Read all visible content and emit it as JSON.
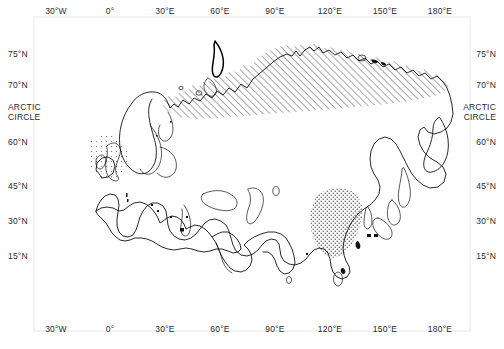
{
  "figure": {
    "type": "map",
    "title": "",
    "projection_note": "Eurasia coastline outline map with latitude and longitude graticule labels",
    "background_color": "#ffffff",
    "line_color": "#111111",
    "label_color": "#2b2b2b",
    "width": 504,
    "height": 349
  },
  "axes": {
    "longitude_top": [
      {
        "label": "30°W",
        "x": 56
      },
      {
        "label": "0°",
        "x": 110
      },
      {
        "label": "30°E",
        "x": 165
      },
      {
        "label": "60°E",
        "x": 220
      },
      {
        "label": "90°E",
        "x": 275
      },
      {
        "label": "120°E",
        "x": 330
      },
      {
        "label": "150°E",
        "x": 385
      },
      {
        "label": "180°E",
        "x": 440
      }
    ],
    "longitude_bottom": [
      {
        "label": "30°W",
        "x": 56
      },
      {
        "label": "0°",
        "x": 110
      },
      {
        "label": "30°E",
        "x": 165
      },
      {
        "label": "60°E",
        "x": 220
      },
      {
        "label": "90°E",
        "x": 275
      },
      {
        "label": "120°E",
        "x": 330
      },
      {
        "label": "150°E",
        "x": 385
      },
      {
        "label": "180°E",
        "x": 440
      }
    ],
    "latitude_left": [
      {
        "label": "75°N",
        "y": 53
      },
      {
        "label": "70°N",
        "y": 84
      },
      {
        "label": "ARCTIC",
        "y": 106,
        "label2": "CIRCLE"
      },
      {
        "label": "60°N",
        "y": 141
      },
      {
        "label": "45°N",
        "y": 185
      },
      {
        "label": "30°N",
        "y": 220
      },
      {
        "label": "15°N",
        "y": 255
      }
    ],
    "latitude_right": [
      {
        "label": "75°N",
        "y": 53
      },
      {
        "label": "70°N",
        "y": 84
      },
      {
        "label": "ARCTIC",
        "y": 106,
        "label2": "CIRCLE"
      },
      {
        "label": "60°N",
        "y": 141
      },
      {
        "label": "45°N",
        "y": 185
      },
      {
        "label": "30°N",
        "y": 220
      },
      {
        "label": "15°N",
        "y": 255
      }
    ],
    "arctic_circle_text_line1": "ARCTIC",
    "arctic_circle_text_line2": "CIRCLE"
  },
  "regions": [
    {
      "name": "northern-siberia-hatched-zone",
      "pattern": "diagonal-hatch",
      "description": "Hatched band along the Arctic coast of northern Siberia between roughly 60°E and 170°E"
    },
    {
      "name": "eastern-china-stippled-zone",
      "pattern": "stipple-dots",
      "description": "Stippled area over eastern China between roughly 105°E and 122°E, 25°N to 42°N"
    },
    {
      "name": "north-sea-stippled-zone",
      "pattern": "stipple-dots-light",
      "description": "Light stippling around the British Isles and North Sea"
    }
  ],
  "landmasses": [
    "Eurasia mainland",
    "Iceland",
    "British Isles",
    "Scandinavia",
    "Novaya Zemlya",
    "Svalbard",
    "New Siberian Islands",
    "Kamchatka Peninsula",
    "Sakhalin",
    "Japan",
    "Korean Peninsula",
    "Taiwan",
    "Hainan",
    "Sri Lanka",
    "Arabian Peninsula",
    "North Africa",
    "Mediterranean islands"
  ]
}
